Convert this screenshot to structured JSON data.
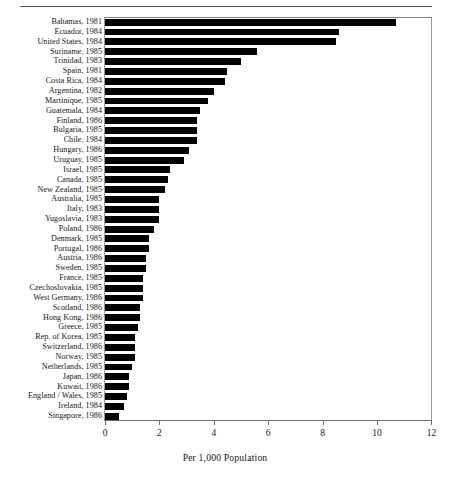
{
  "chart_data": {
    "type": "bar",
    "orientation": "horizontal",
    "title": "",
    "subtitle": "",
    "xlabel": "Per 1,000 Population",
    "ylabel": "",
    "xlim": [
      0,
      12
    ],
    "xticks": [
      0,
      2,
      4,
      6,
      8,
      10,
      12
    ],
    "xtick_labels": [
      "0",
      "2",
      "4",
      "6",
      "8",
      "10",
      "12"
    ],
    "grid": false,
    "legend": null,
    "bar_color": "#000000",
    "categories": [
      "Bahamas, 1981",
      "Ecuador, 1984",
      "United States, 1984",
      "Suriname, 1985",
      "Trinidad, 1983",
      "Spain, 1981",
      "Costa Rica, 1984",
      "Argentina, 1982",
      "Martinique, 1985",
      "Guatemala, 1984",
      "Finland, 1986",
      "Bulgaria, 1985",
      "Chile, 1984",
      "Hungary, 1986",
      "Uruguay, 1985",
      "Israel, 1985",
      "Canada, 1985",
      "New Zealand, 1985",
      "Australia, 1985",
      "Italy, 1983",
      "Yugoslavia, 1983",
      "Poland, 1986",
      "Denmark, 1985",
      "Portugal, 1986",
      "Austria, 1986",
      "Sweden, 1985",
      "France, 1985",
      "Czechoslovakia, 1985",
      "West Germany, 1986",
      "Scotland, 1986",
      "Hong Kong, 1986",
      "Greece, 1985",
      "Rep. of Korea, 1985",
      "Switzerland, 1986",
      "Norway, 1985",
      "Netherlands, 1985",
      "Japan, 1986",
      "Kuwait, 1986",
      "England / Wales, 1985",
      "Ireland, 1984",
      "Singapore, 1986"
    ],
    "values": [
      10.7,
      8.6,
      8.5,
      5.6,
      5.0,
      4.5,
      4.4,
      4.0,
      3.8,
      3.5,
      3.4,
      3.4,
      3.4,
      3.1,
      2.9,
      2.4,
      2.3,
      2.2,
      2.0,
      2.0,
      2.0,
      1.8,
      1.6,
      1.6,
      1.5,
      1.5,
      1.4,
      1.4,
      1.4,
      1.3,
      1.3,
      1.2,
      1.1,
      1.1,
      1.1,
      1.0,
      0.9,
      0.9,
      0.8,
      0.7,
      0.5
    ]
  }
}
